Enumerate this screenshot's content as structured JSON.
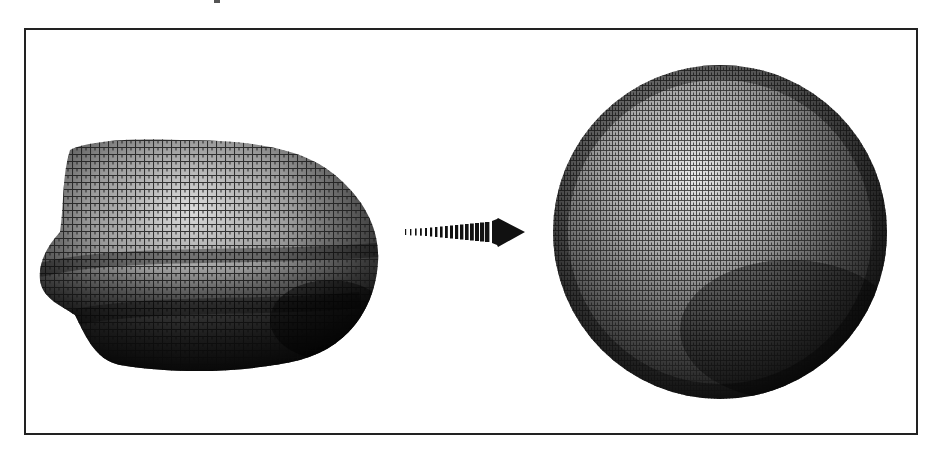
{
  "figure": {
    "frame": {
      "border_color": "#222222",
      "background": "#ffffff"
    },
    "left_shape": {
      "label": "irregular-blob",
      "texture": "grid-mesh",
      "shading_dark": "#111111",
      "shading_light": "#d8d8d8"
    },
    "arrow": {
      "direction": "right",
      "style": "dashed-gradient",
      "color": "#111111"
    },
    "right_shape": {
      "label": "sphere",
      "texture": "grid-mesh",
      "shading_dark": "#0a0a0a",
      "shading_light": "#e6e6e6"
    }
  }
}
